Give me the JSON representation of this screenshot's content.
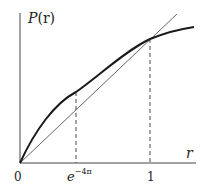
{
  "diagram": {
    "y_axis_label_fn": "P",
    "y_axis_label_arg": "(r)",
    "x_axis_label": "r",
    "ticks": {
      "origin": "0",
      "first_base": "e",
      "first_exp": "−4π",
      "second": "1"
    },
    "elements": [
      "y-axis",
      "x-axis",
      "identity line y = r",
      "concave curve P(r)",
      "dashed vertical at e^−4π",
      "dashed vertical at 1"
    ],
    "colors": {
      "curve": "#1a1a1a",
      "line": "#555555",
      "axes": "#444444"
    }
  }
}
